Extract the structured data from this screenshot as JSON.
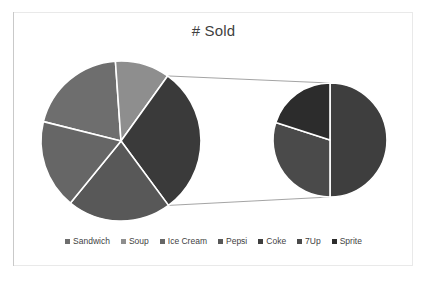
{
  "chart_data": {
    "type": "pie",
    "variant": "pie-of-pie",
    "title": "# Sold",
    "xlabel": "",
    "ylabel": "",
    "legend_position": "bottom",
    "grid": false,
    "categories": [
      "Sandwich",
      "Soup",
      "Ice Cream",
      "Pepsi",
      "Coke",
      "7Up",
      "Sprite"
    ],
    "values": [
      20,
      11,
      18,
      21,
      15,
      9,
      6
    ],
    "colors": [
      "#6e6e6e",
      "#8e8e8e",
      "#666666",
      "#585858",
      "#3e3e3e",
      "#4a4a4a",
      "#2c2c2c"
    ],
    "primary_pie": {
      "slices": [
        {
          "label": "Sandwich",
          "value": 20,
          "percent": 20,
          "color": "#6e6e6e"
        },
        {
          "label": "Soup",
          "value": 11,
          "percent": 11,
          "color": "#8e8e8e"
        },
        {
          "label": "Other",
          "value": 30,
          "percent": 30,
          "color": "#3a3a3a"
        },
        {
          "label": "Pepsi",
          "value": 21,
          "percent": 21,
          "color": "#585858"
        },
        {
          "label": "Ice Cream",
          "value": 18,
          "percent": 18,
          "color": "#666666"
        }
      ]
    },
    "secondary_pie": {
      "label": "Other",
      "slices": [
        {
          "label": "Coke",
          "value": 15,
          "percent": 50,
          "color": "#3e3e3e"
        },
        {
          "label": "7Up",
          "value": 9,
          "percent": 30,
          "color": "#4a4a4a"
        },
        {
          "label": "Sprite",
          "value": 6,
          "percent": 20,
          "color": "#2c2c2c"
        }
      ]
    }
  },
  "chart": {
    "title": "# Sold"
  },
  "legend": {
    "items": [
      {
        "label": "Sandwich",
        "color": "#6e6e6e"
      },
      {
        "label": "Soup",
        "color": "#8e8e8e"
      },
      {
        "label": "Ice Cream",
        "color": "#666666"
      },
      {
        "label": "Pepsi",
        "color": "#585858"
      },
      {
        "label": "Coke",
        "color": "#3e3e3e"
      },
      {
        "label": "7Up",
        "color": "#4a4a4a"
      },
      {
        "label": "Sprite",
        "color": "#2c2c2c"
      }
    ]
  }
}
